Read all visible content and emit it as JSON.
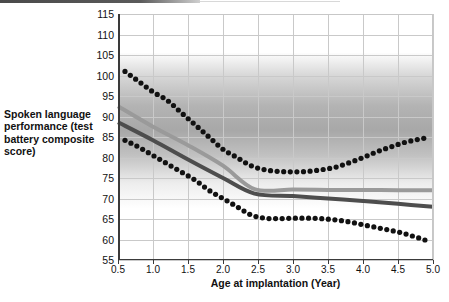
{
  "figure": {
    "ylabel": "Spoken language performance (test battery composite score)",
    "xlabel": "Age at implantation (Year)"
  },
  "chart_data": {
    "type": "line",
    "title": "",
    "xlabel": "Age at implantation (Year)",
    "ylabel": "Spoken language performance (test battery composite score)",
    "xlim": [
      0.5,
      5.0
    ],
    "ylim": [
      55,
      115
    ],
    "xticks": [
      "0.5",
      "1.0",
      "1.5",
      "2.0",
      "2.5",
      "3.0",
      "3.5",
      "4.0",
      "4.5",
      "5.0"
    ],
    "yticks": [
      "55",
      "60",
      "65",
      "70",
      "75",
      "80",
      "85",
      "90",
      "95",
      "100",
      "105",
      "110",
      "115"
    ],
    "grid": true,
    "legend": "none",
    "background_band": {
      "description": "gray vertical gradient band shading the upper plot region",
      "y_range": [
        78,
        110
      ],
      "color": "#6e6e6e"
    },
    "series": [
      {
        "name": "upper confidence bound",
        "style": "dotted",
        "color": "#111111",
        "x": [
          0.6,
          0.8,
          1.0,
          1.2,
          1.4,
          1.6,
          1.8,
          2.0,
          2.2,
          2.4,
          2.6,
          2.8,
          3.0,
          3.2,
          3.4,
          3.6,
          3.8,
          4.0,
          4.2,
          4.4,
          4.6,
          4.9
        ],
        "values": [
          101.0,
          98.5,
          96.0,
          94.0,
          91.0,
          88.0,
          85.0,
          82.0,
          80.0,
          78.0,
          77.0,
          76.6,
          76.5,
          76.6,
          77.0,
          77.6,
          78.7,
          80.0,
          81.4,
          82.6,
          83.7,
          84.8
        ]
      },
      {
        "name": "fitted curve light gray",
        "style": "solid",
        "color": "#9a9a9a",
        "x": [
          0.5,
          1.0,
          1.5,
          2.0,
          2.45,
          3.0,
          3.5,
          4.0,
          4.5,
          5.0
        ],
        "values": [
          92.5,
          87.5,
          83.0,
          78.0,
          72.3,
          72.2,
          72.1,
          72.1,
          72.0,
          72.0
        ]
      },
      {
        "name": "fitted curve dark gray",
        "style": "solid",
        "color": "#4d4d4d",
        "x": [
          0.5,
          1.0,
          1.5,
          2.0,
          2.45,
          3.0,
          3.5,
          4.0,
          4.5,
          5.0
        ],
        "values": [
          88.6,
          84.2,
          79.5,
          75.0,
          71.2,
          70.6,
          70.0,
          69.4,
          68.7,
          68.0
        ]
      },
      {
        "name": "lower confidence bound",
        "style": "dotted",
        "color": "#111111",
        "x": [
          0.6,
          0.8,
          1.0,
          1.2,
          1.4,
          1.6,
          1.8,
          2.0,
          2.2,
          2.4,
          2.6,
          2.8,
          3.0,
          3.2,
          3.4,
          3.6,
          3.8,
          4.0,
          4.2,
          4.4,
          4.6,
          4.9
        ],
        "values": [
          84.2,
          82.5,
          80.5,
          78.5,
          76.5,
          74.5,
          72.0,
          70.0,
          68.0,
          66.0,
          65.2,
          65.1,
          65.2,
          65.2,
          65.1,
          64.8,
          64.3,
          63.6,
          62.9,
          62.2,
          61.4,
          59.8
        ]
      }
    ]
  }
}
